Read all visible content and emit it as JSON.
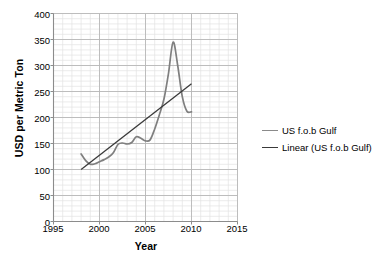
{
  "chart_data": {
    "type": "line",
    "title": "",
    "xlabel": "Year",
    "ylabel": "USD per Metric Ton",
    "xlim": [
      1995,
      2015
    ],
    "ylim": [
      0,
      400
    ],
    "xticks": [
      1995,
      2000,
      2005,
      2010,
      2015
    ],
    "yticks": [
      0,
      50,
      100,
      150,
      200,
      250,
      300,
      350,
      400
    ],
    "x_minor_step": 1,
    "y_minor_step": 10,
    "grid": true,
    "legend_position": "right",
    "series": [
      {
        "name": "US f.o.b Gulf",
        "color": "#7f7f7f",
        "x": [
          1998,
          1998.5,
          1999,
          1999.5,
          2000,
          2000.5,
          2001,
          2001.5,
          2002,
          2002.5,
          2003,
          2003.5,
          2004,
          2004.5,
          2005,
          2005.5,
          2006,
          2006.5,
          2007,
          2007.5,
          2008,
          2008.5,
          2009,
          2009.5,
          2010
        ],
        "values": [
          130,
          117,
          110,
          111,
          115,
          119,
          124,
          132,
          148,
          151,
          149,
          152,
          163,
          160,
          155,
          157,
          178,
          205,
          235,
          285,
          345,
          300,
          240,
          212,
          211
        ]
      },
      {
        "name": "Linear (US f.o.b Gulf)",
        "color": "#3a3a3a",
        "x": [
          1998,
          2010
        ],
        "values": [
          100,
          265
        ]
      }
    ],
    "legend": [
      "US f.o.b Gulf",
      "Linear (US f.o.b Gulf)"
    ],
    "annotations": []
  },
  "axes": {
    "y_title": "USD per Metric Ton",
    "x_title": "Year",
    "y_tick_labels": [
      "400",
      "350",
      "300",
      "250",
      "200",
      "150",
      "100",
      "50",
      "0"
    ],
    "x_tick_labels": [
      "1995",
      "2000",
      "2005",
      "2010",
      "2015"
    ]
  },
  "legend": {
    "items": [
      {
        "label": "US f.o.b Gulf",
        "color": "#8a8a8a"
      },
      {
        "label": "Linear (US f.o.b Gulf)",
        "color": "#3a3a3a"
      }
    ]
  },
  "colors": {
    "series": "#7f7f7f",
    "trend": "#3a3a3a",
    "major_grid": "#b8b8b8",
    "minor_grid": "#e3e3e3",
    "axis": "#8c8c8c",
    "text": "#000000"
  }
}
